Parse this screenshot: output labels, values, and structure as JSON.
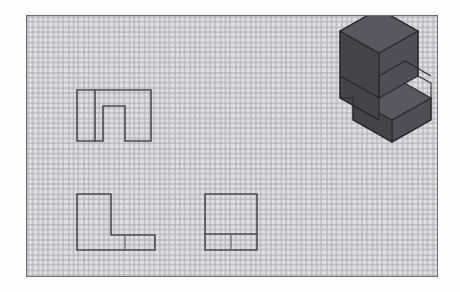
{
  "document": {
    "title": "Orthographic Projection Worksheet",
    "sheet_type": "graph-paper",
    "background_color": "#ffffff",
    "frame_color": "#6d6d6d",
    "grid_color": "#9a9aa4",
    "grid_spacing_px": 15.2,
    "line_color": "#4a4a52"
  },
  "frame": {
    "x": 26,
    "y": 15,
    "width": 412,
    "height": 262
  },
  "views": [
    {
      "id": "top-view",
      "name": "top-view",
      "label": "",
      "description": "Rectangle with rectangular U-notch cut into the lower edge and a vertical division line near the left",
      "outline_points": "50,74 124,74 124,125 98,125 98,90 76,90 76,125 50,125 50,74",
      "interior_lines": [
        "68,74 68,125"
      ]
    },
    {
      "id": "front-view",
      "name": "front-view",
      "label": "",
      "description": "L-shaped profile: tall left leg with a low horizontal foot extending to the right",
      "outline_points": "50,178 84,178 84,219 128,219 128,234 50,234 50,178",
      "interior_lines": [
        "98,219 98,234",
        "84,219 128,219"
      ]
    },
    {
      "id": "side-view",
      "name": "side-view",
      "label": "",
      "description": "Rectangle with a horizontal line near the bottom and a short vertical line below it",
      "outline_points": "178,178 230,178 230,234 178,234 178,178",
      "interior_lines": [
        "178,218 230,218",
        "204,218 204,234"
      ]
    }
  ],
  "pictorial": {
    "id": "isometric-pictorial",
    "name": "isometric-pictorial",
    "description": "Shaded isometric of an L-shaped block: tall rectangular prism at the left rear with a lower slab projecting to the right front and a notch between them",
    "colors": {
      "top_face": "#585860",
      "left_face": "#43434a",
      "right_face": "#4e4e56",
      "notch_face": "#3a3a40",
      "edge": "#2a2a2e"
    },
    "faces": [
      {
        "name": "tall-block-top",
        "tone": "top_face",
        "points": "299,36 340,16 392,39 351,60"
      },
      {
        "name": "tall-block-left",
        "tone": "left_face",
        "points": "299,36 351,60 351,110 299,86"
      },
      {
        "name": "tall-block-right",
        "tone": "right_face",
        "points": "351,60 392,39 392,76 351,97"
      },
      {
        "name": "slab-top",
        "tone": "top_face",
        "points": "351,97 392,76 404,82 363,103"
      },
      {
        "name": "notch-inner-left",
        "tone": "notch_face",
        "points": "351,97 363,103 363,120 351,114"
      },
      {
        "name": "slab-body-top",
        "tone": "top_face",
        "points": "363,103 404,82 106,0 0,0"
      }
    ]
  },
  "annotations": {
    "visible_text": []
  }
}
